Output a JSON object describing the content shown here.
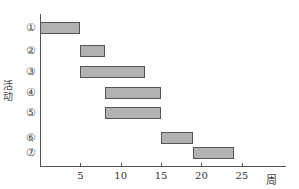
{
  "chart_data": {
    "type": "gantt",
    "title": "",
    "xlabel": "周",
    "ylabel": "活动",
    "xlim": [
      0,
      30
    ],
    "x_ticks": [
      5,
      10,
      15,
      20,
      25
    ],
    "grid": false,
    "legend": null,
    "categories": [
      "①",
      "②",
      "③",
      "④",
      "⑤",
      "⑥",
      "⑦"
    ],
    "tasks": [
      {
        "label": "①",
        "start": 0,
        "end": 5
      },
      {
        "label": "②",
        "start": 5,
        "end": 8
      },
      {
        "label": "③",
        "start": 5,
        "end": 13
      },
      {
        "label": "④",
        "start": 8,
        "end": 15
      },
      {
        "label": "⑤",
        "start": 8,
        "end": 15
      },
      {
        "label": "⑥",
        "start": 15,
        "end": 19
      },
      {
        "label": "⑦",
        "start": 19,
        "end": 24
      }
    ],
    "colors": {
      "bar_fill": "#b2b2b2",
      "bar_border": "#555555",
      "axis": "#555555"
    }
  }
}
